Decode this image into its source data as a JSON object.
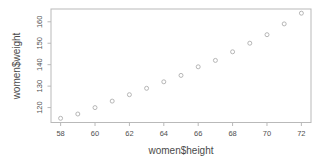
{
  "chart_data": {
    "type": "scatter",
    "title": "",
    "xlabel": "women$height",
    "ylabel": "women$weight",
    "x": [
      58,
      59,
      60,
      61,
      62,
      63,
      64,
      65,
      66,
      67,
      68,
      69,
      70,
      71,
      72
    ],
    "y": [
      115,
      117,
      120,
      123,
      126,
      129,
      132,
      135,
      139,
      142,
      146,
      150,
      154,
      159,
      164
    ],
    "xticks": [
      58,
      60,
      62,
      64,
      66,
      68,
      70,
      72
    ],
    "yticks": [
      120,
      130,
      140,
      150,
      160
    ],
    "xlim": [
      57.44,
      72.56
    ],
    "ylim": [
      113.04,
      165.96
    ],
    "grid": false,
    "legend": null,
    "point_style": "open-circle",
    "colors": {
      "background": "#ffffff",
      "axis_line": "#b9b9b9",
      "tick_mark": "#b9b9b9",
      "text": "#4f4f4f",
      "point_stroke": "#aeaeae"
    }
  }
}
